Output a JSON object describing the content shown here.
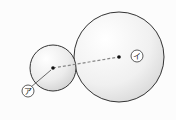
{
  "diagram": {
    "type": "two tangent circles with labeled centers",
    "small_circle": {
      "label": "ア",
      "cx": 53,
      "cy": 68,
      "r": 23
    },
    "large_circle": {
      "label": "イ",
      "cx": 119,
      "cy": 57,
      "r": 45
    },
    "connector": "dashed line between centers",
    "colors": {
      "stroke": "#333333",
      "fill_light": "#ffffff",
      "fill_shade": "#d8d8d8",
      "dash": "#888888"
    }
  },
  "labels": {
    "small": "ア",
    "large": "イ"
  }
}
